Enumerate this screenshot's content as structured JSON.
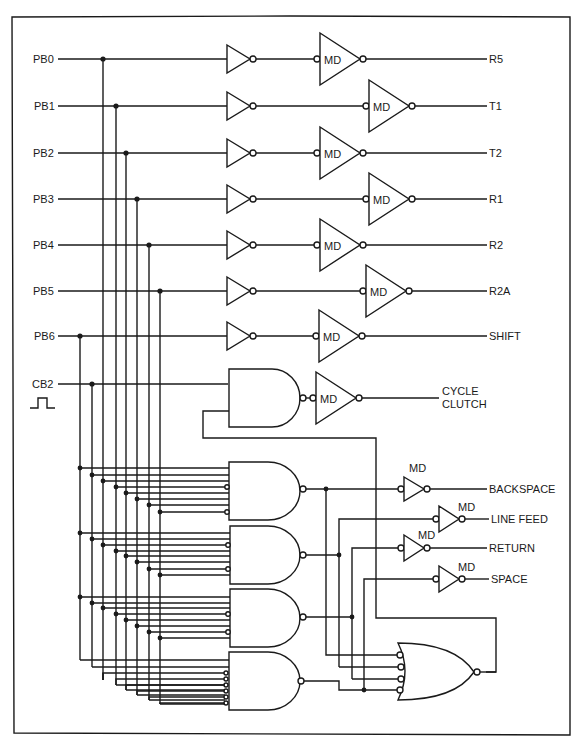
{
  "diagram": {
    "title": "",
    "inputs": [
      {
        "label": "PB0",
        "y": 59
      },
      {
        "label": "PB1",
        "y": 106
      },
      {
        "label": "PB2",
        "y": 153
      },
      {
        "label": "PB3",
        "y": 199
      },
      {
        "label": "PB4",
        "y": 245
      },
      {
        "label": "PB5",
        "y": 291
      },
      {
        "label": "PB6",
        "y": 336
      },
      {
        "label": "CB2",
        "y": 384
      }
    ],
    "driver_label": "MD",
    "outputs": [
      {
        "label": "R5"
      },
      {
        "label": "T1"
      },
      {
        "label": "T2"
      },
      {
        "label": "R1"
      },
      {
        "label": "R2"
      },
      {
        "label": "R2A"
      },
      {
        "label": "SHIFT"
      }
    ],
    "cycle_clutch": {
      "line1": "CYCLE",
      "line2": "CLUTCH"
    },
    "function_outputs": [
      {
        "label": "BACKSPACE"
      },
      {
        "label": "LINE FEED"
      },
      {
        "label": "RETURN"
      },
      {
        "label": "SPACE"
      }
    ],
    "pulse_symbol": "clock-pulse"
  }
}
